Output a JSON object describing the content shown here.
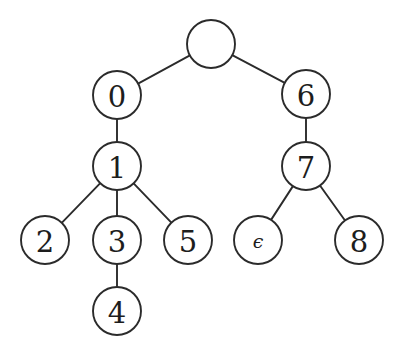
{
  "figure": {
    "kind": "tree-diagram",
    "background_color": "#ffffff",
    "stroke_color": "#2b2b2b",
    "label_color": "#1d1d1d",
    "width": 398,
    "height": 356
  },
  "tree": {
    "node_radius": 24,
    "nodes": [
      {
        "id": "root",
        "label": "",
        "cx": 211,
        "cy": 44,
        "r": 24,
        "empty": true,
        "symbol": false
      },
      {
        "id": "n0",
        "label": "0",
        "cx": 117,
        "cy": 95,
        "r": 24,
        "empty": false,
        "symbol": false
      },
      {
        "id": "n6",
        "label": "6",
        "cx": 306,
        "cy": 94,
        "r": 24,
        "empty": false,
        "symbol": false
      },
      {
        "id": "n1",
        "label": "1",
        "cx": 117,
        "cy": 166,
        "r": 24,
        "empty": false,
        "symbol": false
      },
      {
        "id": "n7",
        "label": "7",
        "cx": 306,
        "cy": 166,
        "r": 24,
        "empty": false,
        "symbol": false
      },
      {
        "id": "n2",
        "label": "2",
        "cx": 45,
        "cy": 240,
        "r": 24,
        "empty": false,
        "symbol": false
      },
      {
        "id": "n3",
        "label": "3",
        "cx": 117,
        "cy": 240,
        "r": 24,
        "empty": false,
        "symbol": false
      },
      {
        "id": "n5",
        "label": "5",
        "cx": 188,
        "cy": 240,
        "r": 24,
        "empty": false,
        "symbol": false
      },
      {
        "id": "neps",
        "label": "ϵ",
        "cx": 258,
        "cy": 240,
        "r": 24,
        "empty": false,
        "symbol": true
      },
      {
        "id": "n8",
        "label": "8",
        "cx": 359,
        "cy": 240,
        "r": 24,
        "empty": false,
        "symbol": false
      },
      {
        "id": "n4",
        "label": "4",
        "cx": 117,
        "cy": 311,
        "r": 24,
        "empty": false,
        "symbol": false
      }
    ],
    "edges": [
      {
        "from": "root",
        "to": "n0"
      },
      {
        "from": "root",
        "to": "n6"
      },
      {
        "from": "n0",
        "to": "n1"
      },
      {
        "from": "n6",
        "to": "n7"
      },
      {
        "from": "n1",
        "to": "n2"
      },
      {
        "from": "n1",
        "to": "n3"
      },
      {
        "from": "n1",
        "to": "n5"
      },
      {
        "from": "n3",
        "to": "n4"
      },
      {
        "from": "n7",
        "to": "neps"
      },
      {
        "from": "n7",
        "to": "n8"
      }
    ]
  }
}
